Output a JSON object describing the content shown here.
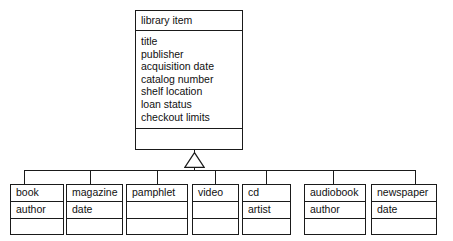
{
  "diagram": {
    "type": "uml-class-diagram",
    "relationship": "generalization",
    "colors": {
      "background": "#ffffff",
      "stroke": "#1a1a1a",
      "text": "#101010"
    }
  },
  "parent": {
    "name": "library item",
    "attributes": [
      "title",
      "publisher",
      "acquisition date",
      "catalog number",
      "shelf location",
      "loan status",
      "checkout limits"
    ],
    "operations": []
  },
  "subclasses": [
    {
      "name": "book",
      "attributes": [
        "author"
      ],
      "operations": []
    },
    {
      "name": "magazine",
      "attributes": [
        "date"
      ],
      "operations": []
    },
    {
      "name": "pamphlet",
      "attributes": [],
      "operations": []
    },
    {
      "name": "video",
      "attributes": [],
      "operations": []
    },
    {
      "name": "cd",
      "attributes": [
        "artist"
      ],
      "operations": []
    },
    {
      "name": "audiobook",
      "attributes": [
        "author"
      ],
      "operations": []
    },
    {
      "name": "newspaper",
      "attributes": [
        "date"
      ],
      "operations": []
    }
  ]
}
